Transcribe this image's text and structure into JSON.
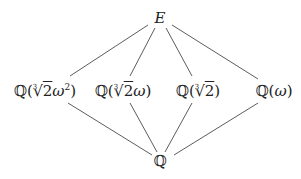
{
  "diagram": {
    "type": "field-extension-lattice",
    "nodes": [
      {
        "id": "E",
        "label": "E",
        "level": "top"
      },
      {
        "id": "n1",
        "label": "ℚ(∛2ω²)",
        "level": "middle",
        "parts": {
          "field": "ℚ",
          "open": "(",
          "root_index": "3",
          "radical": "√",
          "radicand": "2",
          "var": "ω",
          "exp": "2",
          "close": ")"
        }
      },
      {
        "id": "n2",
        "label": "ℚ(∛2ω)",
        "level": "middle",
        "parts": {
          "field": "ℚ",
          "open": "(",
          "root_index": "3",
          "radical": "√",
          "radicand": "2",
          "var": "ω",
          "close": ")"
        }
      },
      {
        "id": "n3",
        "label": "ℚ(∛2)",
        "level": "middle",
        "parts": {
          "field": "ℚ",
          "open": "(",
          "root_index": "3",
          "radical": "√",
          "radicand": "2",
          "close": ")"
        }
      },
      {
        "id": "n4",
        "label": "ℚ(ω)",
        "level": "middle",
        "parts": {
          "field": "ℚ",
          "open": "(",
          "var": "ω",
          "close": ")"
        }
      },
      {
        "id": "Q",
        "label": "ℚ",
        "level": "bottom"
      }
    ],
    "edges": [
      {
        "from": "E",
        "to": "n1"
      },
      {
        "from": "E",
        "to": "n2"
      },
      {
        "from": "E",
        "to": "n3"
      },
      {
        "from": "E",
        "to": "n4"
      },
      {
        "from": "n1",
        "to": "Q"
      },
      {
        "from": "n2",
        "to": "Q"
      },
      {
        "from": "n3",
        "to": "Q"
      },
      {
        "from": "n4",
        "to": "Q"
      }
    ]
  }
}
